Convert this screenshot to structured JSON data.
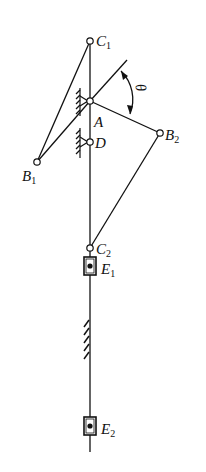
{
  "diagram": {
    "type": "linkage-mechanism",
    "labels": {
      "C1": "C",
      "C1_sub": "1",
      "A": "A",
      "D": "D",
      "B1": "B",
      "B1_sub": "1",
      "B2": "B",
      "B2_sub": "2",
      "C2": "C",
      "C2_sub": "2",
      "E1": "E",
      "E1_sub": "1",
      "E2": "E",
      "E2_sub": "2",
      "theta": "θ"
    },
    "points": {
      "C1": [
        90,
        41
      ],
      "A": [
        90,
        101
      ],
      "D": [
        90,
        142
      ],
      "B1": [
        37,
        162
      ],
      "B2": [
        160,
        133
      ],
      "C2": [
        90,
        248
      ],
      "E1": [
        90,
        266
      ],
      "E2": [
        90,
        426
      ]
    },
    "colors": {
      "stroke": "#111111",
      "background": "#ffffff"
    }
  }
}
